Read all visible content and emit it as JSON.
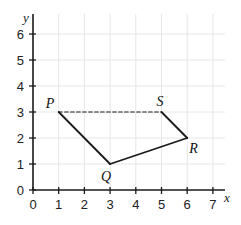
{
  "diagram": {
    "axes": {
      "x_label": "x",
      "y_label": "y",
      "x_ticks": [
        "0",
        "1",
        "2",
        "3",
        "4",
        "5",
        "6",
        "7"
      ],
      "y_ticks": [
        "0",
        "1",
        "2",
        "3",
        "4",
        "5",
        "6"
      ],
      "x_range": [
        0,
        7
      ],
      "y_range": [
        0,
        6
      ],
      "grid": true
    },
    "points": [
      {
        "label": "P",
        "x": 1,
        "y": 3
      },
      {
        "label": "Q",
        "x": 3,
        "y": 1
      },
      {
        "label": "R",
        "x": 6,
        "y": 2
      },
      {
        "label": "S",
        "x": 5,
        "y": 3
      }
    ],
    "segments": [
      {
        "from": "P",
        "to": "Q",
        "style": "solid"
      },
      {
        "from": "Q",
        "to": "R",
        "style": "solid"
      },
      {
        "from": "R",
        "to": "S",
        "style": "solid"
      },
      {
        "from": "P",
        "to": "S",
        "style": "dashed"
      }
    ],
    "colors": {
      "line": "#1a1a1a",
      "grid": "#e6e6e6",
      "axis": "#1a1a1a"
    }
  }
}
